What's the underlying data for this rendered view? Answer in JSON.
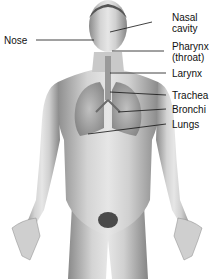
{
  "diagram": {
    "labels": [
      {
        "id": "nose",
        "text": "Nose"
      },
      {
        "id": "nasal_cavity",
        "text": "Nasal",
        "text2": "cavity"
      },
      {
        "id": "pharynx",
        "text": "Pharynx",
        "text2": "(throat)"
      },
      {
        "id": "larynx",
        "text": "Larynx"
      },
      {
        "id": "trachea",
        "text": "Trachea"
      },
      {
        "id": "bronchi",
        "text": "Bronchi"
      },
      {
        "id": "lungs",
        "text": "Lungs"
      }
    ]
  }
}
